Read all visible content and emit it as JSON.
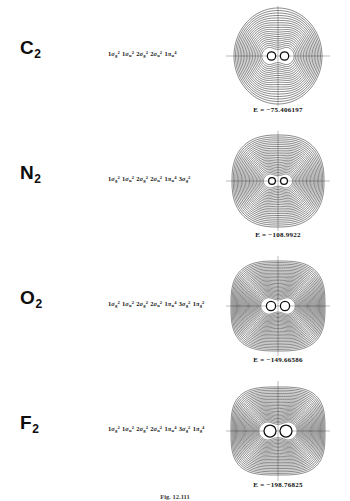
{
  "figure": {
    "caption": "Fig. 12.111",
    "rows": [
      {
        "molecule": "C",
        "subscript": "2",
        "config": [
          {
            "label": "1",
            "greek": "σ",
            "sub": "g",
            "sup": "2"
          },
          {
            "label": "1",
            "greek": "σ",
            "sub": "u",
            "sup": "2"
          },
          {
            "label": "2",
            "greek": "σ",
            "sub": "g",
            "sup": "2"
          },
          {
            "label": "2",
            "greek": "σ",
            "sub": "u",
            "sup": "2"
          },
          {
            "label": "1",
            "greek": "π",
            "sub": "u",
            "sup": "4"
          }
        ],
        "energy": "E = −75.406197",
        "plot": {
          "rings": 19,
          "outer_rx": 44,
          "outer_ry": 48,
          "squareness": 0.0,
          "nucleus_r": 4.2,
          "nucleus_sep": 11,
          "waist": "pinched",
          "lobe_rx": 9.5,
          "lobe_ry": 8.5
        }
      },
      {
        "molecule": "N",
        "subscript": "2",
        "config": [
          {
            "label": "1",
            "greek": "σ",
            "sub": "g",
            "sup": "2"
          },
          {
            "label": "1",
            "greek": "σ",
            "sub": "u",
            "sup": "2"
          },
          {
            "label": "2",
            "greek": "σ",
            "sub": "g",
            "sup": "2"
          },
          {
            "label": "2",
            "greek": "σ",
            "sub": "u",
            "sup": "2"
          },
          {
            "label": "1",
            "greek": "π",
            "sub": "u",
            "sup": "4"
          },
          {
            "label": "3",
            "greek": "σ",
            "sub": "g",
            "sup": "2"
          }
        ],
        "energy": "E = −108.9922",
        "plot": {
          "rings": 24,
          "outer_rx": 46,
          "outer_ry": 46,
          "squareness": 0.08,
          "nucleus_r": 3.4,
          "nucleus_sep": 10,
          "waist": "merged",
          "lobe_rx": 8.5,
          "lobe_ry": 7.0
        }
      },
      {
        "molecule": "O",
        "subscript": "2",
        "config": [
          {
            "label": "1",
            "greek": "σ",
            "sub": "g",
            "sup": "2"
          },
          {
            "label": "1",
            "greek": "σ",
            "sub": "u",
            "sup": "2"
          },
          {
            "label": "2",
            "greek": "σ",
            "sub": "g",
            "sup": "2"
          },
          {
            "label": "2",
            "greek": "σ",
            "sub": "u",
            "sup": "2"
          },
          {
            "label": "1",
            "greek": "π",
            "sub": "u",
            "sup": "4"
          },
          {
            "label": "3",
            "greek": "σ",
            "sub": "g",
            "sup": "2"
          },
          {
            "label": "1",
            "greek": "π",
            "sub": "g",
            "sup": "2"
          }
        ],
        "energy": "E = −149.66586",
        "plot": {
          "rings": 28,
          "outer_rx": 47,
          "outer_ry": 45,
          "squareness": 0.16,
          "nucleus_r": 4.6,
          "nucleus_sep": 12,
          "waist": "pinched",
          "lobe_rx": 10.5,
          "lobe_ry": 9.0
        }
      },
      {
        "molecule": "F",
        "subscript": "2",
        "config": [
          {
            "label": "1",
            "greek": "σ",
            "sub": "g",
            "sup": "2"
          },
          {
            "label": "1",
            "greek": "σ",
            "sub": "u",
            "sup": "2"
          },
          {
            "label": "2",
            "greek": "σ",
            "sub": "g",
            "sup": "2"
          },
          {
            "label": "2",
            "greek": "σ",
            "sub": "u",
            "sup": "2"
          },
          {
            "label": "1",
            "greek": "π",
            "sub": "u",
            "sup": "4"
          },
          {
            "label": "3",
            "greek": "σ",
            "sub": "g",
            "sup": "2"
          },
          {
            "label": "1",
            "greek": "π",
            "sub": "g",
            "sup": "4"
          }
        ],
        "energy": "E = −198.76825",
        "plot": {
          "rings": 26,
          "outer_rx": 47,
          "outer_ry": 44,
          "squareness": 0.2,
          "nucleus_r": 6.0,
          "nucleus_sep": 14,
          "waist": "separated",
          "lobe_rx": 11.5,
          "lobe_ry": 10.0
        }
      }
    ]
  }
}
